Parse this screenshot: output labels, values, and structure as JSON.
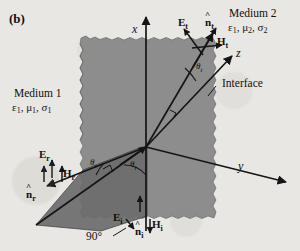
{
  "figure": {
    "panel_tag": "(b)",
    "caption_elements": {
      "interface_label": "Interface",
      "right_angle_label": "90°"
    }
  },
  "media": {
    "medium1": {
      "name": "Medium 1",
      "permittivity": "ε",
      "permittivity_sub": "1",
      "permeability": "μ",
      "permeability_sub": "1",
      "conductivity": "σ",
      "conductivity_sub": "1",
      "params": "ε1, μ1, σ1"
    },
    "medium2": {
      "name": "Medium 2",
      "permittivity": "ε",
      "permittivity_sub": "1",
      "permeability": "μ",
      "permeability_sub": "2",
      "conductivity": "σ",
      "conductivity_sub": "2",
      "params": "ε1, μ2, σ2"
    }
  },
  "axes": {
    "x": "x",
    "y": "y",
    "z": "z"
  },
  "waves": {
    "transmitted": {
      "E": "E",
      "E_sub": "t",
      "H": "H",
      "H_sub": "t",
      "n": "n",
      "n_sub": "t",
      "angle": "θ",
      "angle_sub": "t"
    },
    "reflected": {
      "E": "E",
      "E_sub": "r",
      "H": "H",
      "H_sub": "r",
      "n": "n",
      "n_sub": "r",
      "angle": "θ",
      "angle_sub": "r"
    },
    "incident": {
      "E": "E",
      "E_sub": "i",
      "H": "H",
      "H_sub": "i",
      "n": "n",
      "n_sub": "i",
      "angle": "θ",
      "angle_sub": "i"
    }
  },
  "colors": {
    "background": "#e9e7e3",
    "interface_plane": "#8d8d8d",
    "incidence_plane": "#6f6f6f",
    "line": "#151515",
    "text": "#101010"
  }
}
